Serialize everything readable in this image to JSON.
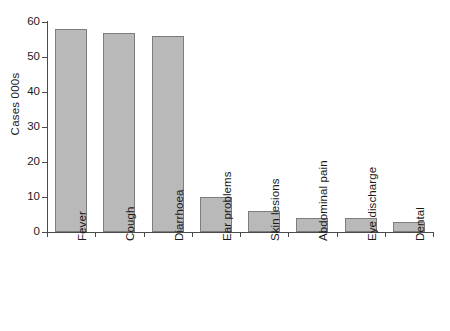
{
  "chart_data": {
    "type": "bar",
    "title": "",
    "subtitle": "",
    "xlabel": "",
    "ylabel": "Cases 000s",
    "categories": [
      "Fever",
      "Cough",
      "Diarrhoea",
      "Ear problems",
      "Skin lesions",
      "Abdominal pain",
      "Eye discharge",
      "Dental"
    ],
    "values": [
      58,
      57,
      56,
      10,
      6,
      4,
      4,
      3
    ],
    "ylim": [
      0,
      60
    ],
    "yticks": [
      0,
      10,
      20,
      30,
      40,
      50,
      60
    ],
    "ytick_labels": [
      "0",
      "10",
      "20",
      "30",
      "40",
      "50",
      "60"
    ],
    "grid": false,
    "legend": null,
    "bar_fill_color": "#b9b9b9",
    "bar_edge_color": "#7d7d7d",
    "axis_color": "#4a4a4a",
    "background_color": "#ffffff"
  }
}
